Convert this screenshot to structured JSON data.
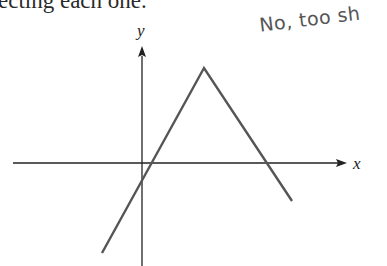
{
  "text": {
    "prose_fragment": "ecting each one.",
    "handwritten_note": "No, too sh"
  },
  "graph": {
    "x_axis_label": "x",
    "y_axis_label": "y",
    "curve": "piecewise linear tent shape: rises from lower-left through the axes to a peak, then descends crossing the x-axis",
    "line_color": "#555555",
    "axis_color": "#222222"
  }
}
